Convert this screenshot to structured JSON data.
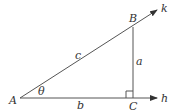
{
  "diagram": {
    "type": "right-triangle",
    "colors": {
      "line": "#555555",
      "text": "#333333",
      "background": "#ffffff"
    },
    "vertices": {
      "A": {
        "label": "A"
      },
      "B": {
        "label": "B"
      },
      "C": {
        "label": "C"
      }
    },
    "sides": {
      "hypotenuse": {
        "label": "c"
      },
      "opposite": {
        "label": "a"
      },
      "adjacent": {
        "label": "b"
      }
    },
    "angle": {
      "label": "θ"
    },
    "rays": {
      "k": {
        "label": "k"
      },
      "h": {
        "label": "h"
      }
    },
    "right_angle_marker_at": "C"
  }
}
